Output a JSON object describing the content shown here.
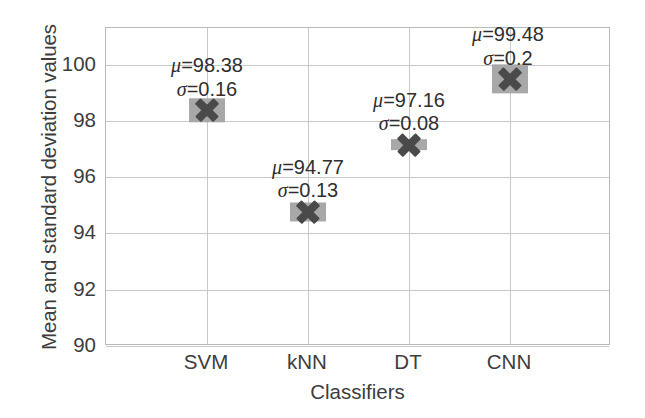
{
  "chart_data": {
    "type": "scatter",
    "title": "",
    "xlabel": "Classifiers",
    "ylabel": "Mean and standard deviation values",
    "categories": [
      "SVM",
      "kNN",
      "DT",
      "CNN"
    ],
    "values": [
      98.38,
      94.77,
      97.16,
      99.48
    ],
    "errors": [
      0.16,
      0.13,
      0.08,
      0.2
    ],
    "series": [
      {
        "name": "Mean accuracy",
        "values": [
          98.38,
          94.77,
          97.16,
          99.48
        ],
        "errors": [
          0.16,
          0.13,
          0.08,
          0.2
        ]
      }
    ],
    "points": [
      {
        "category": "SVM",
        "mean": 98.38,
        "sigma": 0.16,
        "mu_label": "μ=98.38",
        "sigma_label": "σ=0.16"
      },
      {
        "category": "kNN",
        "mean": 94.77,
        "sigma": 0.13,
        "mu_label": "μ=94.77",
        "sigma_label": "σ=0.13"
      },
      {
        "category": "DT",
        "mean": 97.16,
        "sigma": 0.08,
        "mu_label": "μ=97.16",
        "sigma_label": "σ=0.08"
      },
      {
        "category": "CNN",
        "mean": 99.48,
        "sigma": 0.2,
        "mu_label": "μ=99.48",
        "sigma_label": "σ=0.2"
      }
    ],
    "ylim": [
      90,
      101.3
    ],
    "yticks": [
      90,
      92,
      94,
      96,
      98,
      100
    ],
    "ytick_labels": [
      "90",
      "92",
      "94",
      "96",
      "98",
      "100"
    ],
    "xtick_labels": [
      "SVM",
      "kNN",
      "DT",
      "CNN"
    ],
    "grid": true,
    "grid_axis": "both",
    "legend": "none",
    "marker": "x",
    "marker_color": "#4a4a4a",
    "errorband_color": "#a8a8a8",
    "gridline_color": "#c9c9c9",
    "frame_color": "#b9b9b9",
    "background_color": "#ffffff",
    "text_color": "#3d3d3d"
  }
}
